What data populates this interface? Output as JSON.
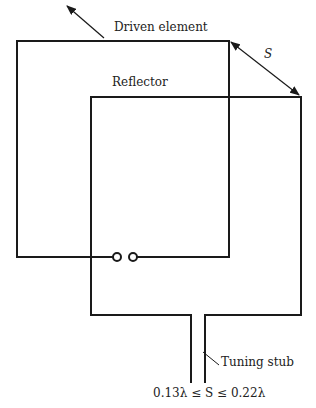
{
  "diagram": {
    "type": "quad-loop antenna",
    "labels": {
      "driven_element": "Driven element",
      "reflector": "Reflector",
      "spacing": "S",
      "tuning_stub": "Tuning stub",
      "formula": "0.13λ ≤ S ≤ 0.22λ"
    },
    "colors": {
      "line": "#1a1a1a",
      "background": "#ffffff"
    }
  }
}
